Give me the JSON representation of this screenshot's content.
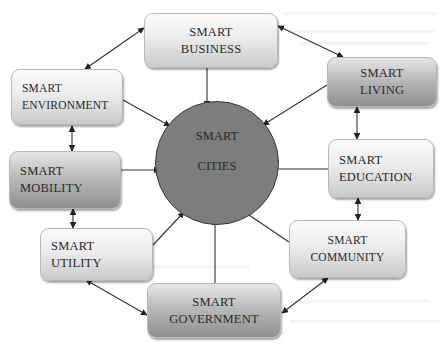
{
  "diagram": {
    "type": "hub-and-spoke concept map",
    "hub": {
      "line1": "SMART",
      "line2": "CITIES",
      "fill": "#7d7d7d"
    },
    "nodes": [
      {
        "id": "business",
        "line1": "SMART",
        "line2": "BUSINESS"
      },
      {
        "id": "environment",
        "line1": "SMART",
        "line2": "ENVIRONMENT"
      },
      {
        "id": "living",
        "line1": "SMART",
        "line2": "LIVING"
      },
      {
        "id": "mobility",
        "line1": "SMART",
        "line2": "MOBILITY"
      },
      {
        "id": "education",
        "line1": "SMART",
        "line2": "EDUCATION"
      },
      {
        "id": "utility",
        "line1": "SMART",
        "line2": "UTILITY"
      },
      {
        "id": "community",
        "line1": "SMART",
        "line2": "COMMUNITY"
      },
      {
        "id": "government",
        "line1": "SMART",
        "line2": "GOVERNMENT"
      }
    ],
    "edges_to_hub": [
      "business",
      "environment",
      "living",
      "mobility",
      "education",
      "utility",
      "community",
      "government"
    ],
    "bidirectional_ring": [
      [
        "business",
        "environment"
      ],
      [
        "business",
        "living"
      ],
      [
        "environment",
        "mobility"
      ],
      [
        "mobility",
        "utility"
      ],
      [
        "utility",
        "government"
      ],
      [
        "government",
        "community"
      ],
      [
        "community",
        "education"
      ],
      [
        "education",
        "living"
      ]
    ]
  }
}
